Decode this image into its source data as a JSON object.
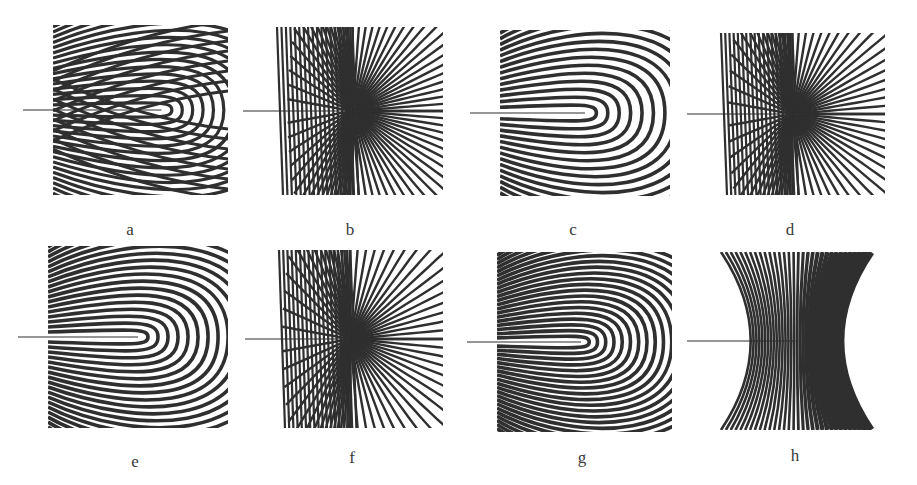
{
  "figure": {
    "ink_color": "#2f2f2f",
    "background": "#ffffff",
    "panels": [
      {
        "id": "a",
        "label": "a",
        "kind": "lobed",
        "box": [
          53,
          25,
          175,
          170
        ],
        "label_pos": [
          110,
          220
        ],
        "crack_tip": 0.62,
        "stripes": 18
      },
      {
        "id": "b",
        "label": "b",
        "kind": "radial",
        "box": [
          273,
          27,
          170,
          168
        ],
        "label_pos": [
          330,
          220
        ],
        "crack_tip": 0.47,
        "stripes": 40
      },
      {
        "id": "c",
        "label": "c",
        "kind": "ring",
        "box": [
          500,
          30,
          170,
          166
        ],
        "label_pos": [
          553,
          220
        ],
        "crack_tip": 0.5,
        "stripes": 16
      },
      {
        "id": "d",
        "label": "d",
        "kind": "radial",
        "box": [
          717,
          33,
          168,
          162
        ],
        "label_pos": [
          770,
          220
        ],
        "crack_tip": 0.45,
        "stripes": 36
      },
      {
        "id": "e",
        "label": "e",
        "kind": "ring",
        "box": [
          48,
          246,
          180,
          182
        ],
        "label_pos": [
          115,
          452
        ],
        "crack_tip": 0.5,
        "stripes": 20
      },
      {
        "id": "f",
        "label": "f",
        "kind": "radial",
        "box": [
          275,
          250,
          168,
          178
        ],
        "label_pos": [
          332,
          448
        ],
        "crack_tip": 0.45,
        "stripes": 34
      },
      {
        "id": "g",
        "label": "g",
        "kind": "ring",
        "box": [
          497,
          252,
          175,
          180
        ],
        "label_pos": [
          562,
          448
        ],
        "crack_tip": 0.48,
        "stripes": 24
      },
      {
        "id": "h",
        "label": "h",
        "kind": "fan",
        "box": [
          717,
          252,
          163,
          178
        ],
        "label_pos": [
          775,
          446
        ],
        "crack_tip": 0.48,
        "stripes": 32
      }
    ]
  }
}
